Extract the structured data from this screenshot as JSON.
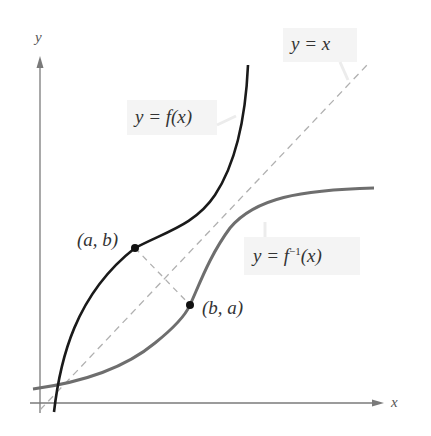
{
  "figure": {
    "axes": {
      "x_label": "x",
      "y_label": "y"
    },
    "labels": {
      "identity_prefix": "y = ",
      "identity_var": "x",
      "f_prefix": "y = ",
      "f_name": "f",
      "f_arg": "(x)",
      "finv_prefix": "y = ",
      "finv_name": "f",
      "finv_sup": "−1",
      "finv_arg": "(x)",
      "point_ab": "(a, b)",
      "point_ba": "(b, a)"
    },
    "colors": {
      "f_curve": "#1a1a1a",
      "finv_curve": "#6e6e6e",
      "axis": "#7a7a7a",
      "identity_line": "#b0b0b0",
      "label_bg": "#f4f4f4",
      "point": "#111111"
    },
    "curves": [
      {
        "name": "f",
        "description": "y = f(x), increasing curve rising steeply to the top"
      },
      {
        "name": "f_inverse",
        "description": "y = f^-1(x), reflection of f across y = x, leveling off to the right"
      },
      {
        "name": "identity",
        "description": "y = x dashed diagonal line"
      }
    ],
    "points": [
      {
        "label": "(a, b)",
        "on": "f"
      },
      {
        "label": "(b, a)",
        "on": "f_inverse"
      }
    ]
  }
}
